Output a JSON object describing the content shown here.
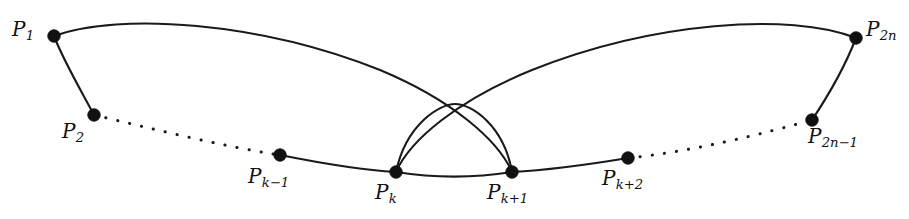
{
  "figure": {
    "background_color": "#ffffff",
    "stroke_color": "#1a1a1a",
    "width": 909,
    "height": 219
  },
  "vertices": [
    {
      "id": "P1",
      "base": "P",
      "sub": "1",
      "x": 54,
      "y": 36,
      "label_x": 12,
      "label_y": 19,
      "label_text": "P1"
    },
    {
      "id": "P2",
      "base": "P",
      "sub": "2",
      "x": 94,
      "y": 115,
      "label_x": 62,
      "label_y": 121,
      "label_text": "P2"
    },
    {
      "id": "Pk-1",
      "base": "P",
      "sub": "k−1",
      "x": 280,
      "y": 155,
      "label_x": 248,
      "label_y": 166,
      "label_text": "Pk−1"
    },
    {
      "id": "Pk",
      "base": "P",
      "sub": "k",
      "x": 396,
      "y": 172,
      "label_x": 375,
      "label_y": 182,
      "label_text": "Pk"
    },
    {
      "id": "Pk+1",
      "base": "P",
      "sub": "k+1",
      "x": 512,
      "y": 172,
      "label_x": 487,
      "label_y": 182,
      "label_text": "Pk+1"
    },
    {
      "id": "Pk+2",
      "base": "P",
      "sub": "k+2",
      "x": 628,
      "y": 158,
      "label_x": 602,
      "label_y": 168,
      "label_text": "Pk+2"
    },
    {
      "id": "P2n-1",
      "base": "P",
      "sub": "2n−1",
      "x": 812,
      "y": 120,
      "label_x": 808,
      "label_y": 126,
      "label_text": "P2n−1"
    },
    {
      "id": "P2n",
      "base": "P",
      "sub": "2n",
      "x": 856,
      "y": 38,
      "label_x": 866,
      "label_y": 19,
      "label_text": "P2n"
    }
  ],
  "edges": [
    {
      "id": "edge-P1-P2",
      "style": "solid",
      "from": "P1",
      "to": "P2",
      "path": "M 54 36 C 64 62 82 92 94 115"
    },
    {
      "id": "edge-P2-Pk-1",
      "style": "dotted",
      "from": "P2",
      "to": "Pk-1",
      "path": "M 94 115 C 150 128 220 146 280 155"
    },
    {
      "id": "edge-Pk-1-Pk",
      "style": "solid",
      "from": "Pk-1",
      "to": "Pk",
      "path": "M 280 155 C 320 163 360 170 396 172"
    },
    {
      "id": "edge-Pk-Pk+1",
      "style": "solid",
      "from": "Pk",
      "to": "Pk+1",
      "path": "M 396 172 C 434 178 474 178 512 172"
    },
    {
      "id": "edge-Pk+1-Pk+2",
      "style": "solid",
      "from": "Pk+1",
      "to": "Pk+2",
      "path": "M 512 172 C 550 170 592 164 628 158"
    },
    {
      "id": "edge-Pk+2-P2n-1",
      "style": "dotted",
      "from": "Pk+2",
      "to": "P2n-1",
      "path": "M 628 158 C 690 152 762 134 812 120"
    },
    {
      "id": "edge-P2n-1-P2n",
      "style": "solid",
      "from": "P2n-1",
      "to": "P2n",
      "path": "M 812 120 C 828 96 846 64 856 38"
    },
    {
      "id": "edge-arch-Pk-Pk+1",
      "style": "solid",
      "from": "Pk",
      "to": "Pk+1",
      "path": "M 396 172 C 406 124 440 104 455 104 C 472 104 504 126 512 172"
    },
    {
      "id": "chord-P1-Pk+1",
      "style": "solid",
      "from": "P1",
      "to": "Pk+1",
      "path": "M 54 36 C 120 12 260 22 380 70 C 452 100 498 140 512 172"
    },
    {
      "id": "chord-P2n-Pk",
      "style": "solid",
      "from": "P2n",
      "to": "Pk",
      "path": "M 856 38 C 790 12 652 22 532 70 C 458 100 410 140 396 172"
    }
  ]
}
